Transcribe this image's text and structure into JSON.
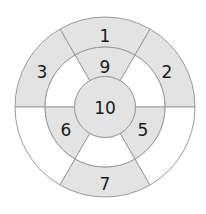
{
  "diagram": {
    "type": "concentric-ring-target",
    "geometry": {
      "cx": 105,
      "cy": 107,
      "outer_r": 90,
      "middle_r": 60,
      "inner_r": 30.5
    },
    "colors": {
      "shaded": "#e3e3e3",
      "unshaded": "#ffffff",
      "stroke": "#9a9a9a",
      "text": "#1a1a1a"
    },
    "outer_ring": [
      {
        "sector": "top",
        "label": "1",
        "shaded": true
      },
      {
        "sector": "upper-right",
        "label": "2",
        "shaded": true
      },
      {
        "sector": "upper-left",
        "label": "3",
        "shaded": true
      },
      {
        "sector": "lower-left",
        "label": "",
        "shaded": false
      },
      {
        "sector": "bottom",
        "label": "7",
        "shaded": true
      },
      {
        "sector": "lower-right",
        "label": "",
        "shaded": false
      }
    ],
    "middle_ring": [
      {
        "sector": "top",
        "label": "9",
        "shaded": true
      },
      {
        "sector": "upper-right",
        "label": "",
        "shaded": false
      },
      {
        "sector": "upper-left",
        "label": "",
        "shaded": false
      },
      {
        "sector": "lower-left",
        "label": "6",
        "shaded": true
      },
      {
        "sector": "bottom",
        "label": "",
        "shaded": false
      },
      {
        "sector": "lower-right",
        "label": "5",
        "shaded": true
      }
    ],
    "center": {
      "label": "10",
      "shaded": true
    }
  }
}
